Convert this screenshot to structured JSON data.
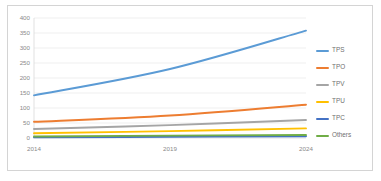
{
  "chart_data": {
    "type": "line",
    "title": "",
    "xlabel": "",
    "ylabel": "",
    "x": [
      2014,
      2019,
      2024
    ],
    "categories": [
      "2014",
      "2019",
      "2024"
    ],
    "ylim": [
      0,
      400
    ],
    "yticks": [
      0,
      50,
      100,
      150,
      200,
      250,
      300,
      350,
      400
    ],
    "ytick_labels": [
      "0",
      "50",
      "100",
      "150",
      "200",
      "250",
      "300",
      "350",
      "400"
    ],
    "xtick_labels": [
      "2014",
      "2019",
      "2024"
    ],
    "grid": "horizontal",
    "legend_position": "right",
    "smooth": true,
    "series": [
      {
        "name": "TPS",
        "values": [
          142,
          230,
          358
        ],
        "color": "#5B9BD5"
      },
      {
        "name": "TPO",
        "values": [
          54,
          75,
          111
        ],
        "color": "#ED7D31"
      },
      {
        "name": "TPV",
        "values": [
          30,
          43,
          60
        ],
        "color": "#A5A5A5"
      },
      {
        "name": "TPU",
        "values": [
          16,
          23,
          32
        ],
        "color": "#FFC000"
      },
      {
        "name": "TPC",
        "values": [
          2,
          4,
          6
        ],
        "color": "#4472C4"
      },
      {
        "name": "Others",
        "values": [
          5,
          8,
          10
        ],
        "color": "#70AD47"
      }
    ]
  },
  "legend": {
    "items": [
      {
        "label": "TPS"
      },
      {
        "label": "TPO"
      },
      {
        "label": "TPV"
      },
      {
        "label": "TPU"
      },
      {
        "label": "TPC"
      },
      {
        "label": "Others"
      }
    ]
  },
  "axes": {
    "y_labels": [
      "400",
      "350",
      "300",
      "250",
      "200",
      "150",
      "100",
      "50",
      "0"
    ],
    "x_labels": [
      "2014",
      "2019",
      "2024"
    ]
  }
}
